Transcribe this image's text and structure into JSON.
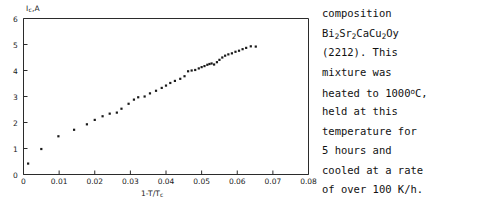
{
  "figure": {
    "y_axis_label": "Ic,A",
    "y_axis_label_main": "I",
    "y_axis_label_sub": "c",
    "y_axis_label_tail": ",A",
    "x_axis_label": "1-T/Tc",
    "x_axis_label_main": "1-T/T",
    "x_axis_label_sub": "c",
    "x_ticks": [
      "0",
      "0.01",
      "0.02",
      "0.03",
      "0.04",
      "0.05",
      "0.06",
      "0.07",
      "0.08"
    ],
    "y_ticks": [
      "0",
      "1",
      "2",
      "3",
      "4",
      "5",
      "6"
    ]
  },
  "caption": {
    "lines": [
      "composition",
      "Bi2Sr2CaCu2Oy",
      "(2212).  This",
      "mixture  was",
      "heated to 1000°C,",
      "held at this",
      "temperature for",
      "5  hours  and",
      "cooled at a rate",
      "of over 100 K/h."
    ],
    "line1": "composition",
    "line2_parts": [
      "Bi",
      "2",
      "Sr",
      "2",
      "CaCu",
      "2",
      "Oy"
    ],
    "line3": "(2212).  This",
    "line4": "mixture  was",
    "line5_pre": "heated to 1000",
    "line5_sup": "o",
    "line5_post": "C,",
    "line6": "held at this",
    "line7": "temperature for",
    "line8": "5  hours  and",
    "line9": "cooled at a rate",
    "line10": "of over 100 K/h."
  },
  "colors": {
    "axis": "#2b2b2b",
    "marker": "#1a1a1a",
    "background": "#ffffff",
    "text": "#111111"
  },
  "chart_data": {
    "type": "scatter",
    "title": "",
    "xlabel": "1-T/Tc",
    "ylabel": "Ic,A",
    "xlim": [
      0,
      0.08
    ],
    "ylim": [
      0,
      6
    ],
    "grid": false,
    "legend": null,
    "xticks": [
      0,
      0.01,
      0.02,
      0.03,
      0.04,
      0.05,
      0.06,
      0.07,
      0.08
    ],
    "yticks": [
      0,
      1,
      2,
      3,
      4,
      5,
      6
    ],
    "series": [
      {
        "name": "Ic vs 1-T/Tc",
        "marker": "dot",
        "x": [
          0.0013,
          0.005,
          0.0098,
          0.0142,
          0.0178,
          0.02,
          0.0222,
          0.0242,
          0.0262,
          0.0275,
          0.0295,
          0.031,
          0.0322,
          0.034,
          0.0355,
          0.0372,
          0.0388,
          0.04,
          0.0412,
          0.0425,
          0.044,
          0.0452,
          0.0462,
          0.0472,
          0.0482,
          0.0492,
          0.05,
          0.0508,
          0.0516,
          0.0522,
          0.0528,
          0.0535,
          0.0543,
          0.055,
          0.0558,
          0.0566,
          0.0575,
          0.0585,
          0.0595,
          0.0605,
          0.0615,
          0.0625,
          0.0638,
          0.0652
        ],
        "y": [
          0.42,
          0.98,
          1.47,
          1.72,
          1.93,
          2.1,
          2.24,
          2.34,
          2.38,
          2.53,
          2.72,
          2.88,
          2.97,
          3.0,
          3.12,
          3.22,
          3.33,
          3.42,
          3.52,
          3.6,
          3.68,
          3.78,
          3.97,
          4.0,
          4.02,
          4.08,
          4.13,
          4.17,
          4.22,
          4.25,
          4.27,
          4.23,
          4.32,
          4.41,
          4.5,
          4.57,
          4.62,
          4.66,
          4.72,
          4.76,
          4.82,
          4.87,
          4.93,
          4.92
        ]
      }
    ]
  }
}
